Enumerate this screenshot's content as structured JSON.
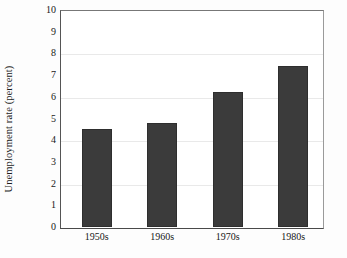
{
  "chart_data": {
    "type": "bar",
    "title": "",
    "subtitle": "",
    "xlabel": "",
    "ylabel": "Unemployment rate (percent)",
    "categories": [
      "1950s",
      "1960s",
      "1970s",
      "1980s"
    ],
    "values": [
      4.5,
      4.8,
      6.2,
      7.4
    ],
    "series": [
      {
        "name": "Unemployment rate",
        "values": [
          4.5,
          4.8,
          6.2,
          7.4
        ]
      }
    ],
    "ylim": [
      0,
      10
    ],
    "yticks": [
      0,
      1,
      2,
      3,
      4,
      5,
      6,
      7,
      8,
      9,
      10
    ],
    "ytick_labels": [
      "0",
      "1",
      "2",
      "3",
      "4",
      "5",
      "6",
      "7",
      "8",
      "9",
      "10"
    ],
    "gridlines_at": [
      2,
      4,
      6,
      8
    ],
    "grid": true,
    "legend": false,
    "legend_position": "none",
    "bar_color": "#3b3b3b",
    "plot_background": "#ffffff",
    "annotations": []
  }
}
